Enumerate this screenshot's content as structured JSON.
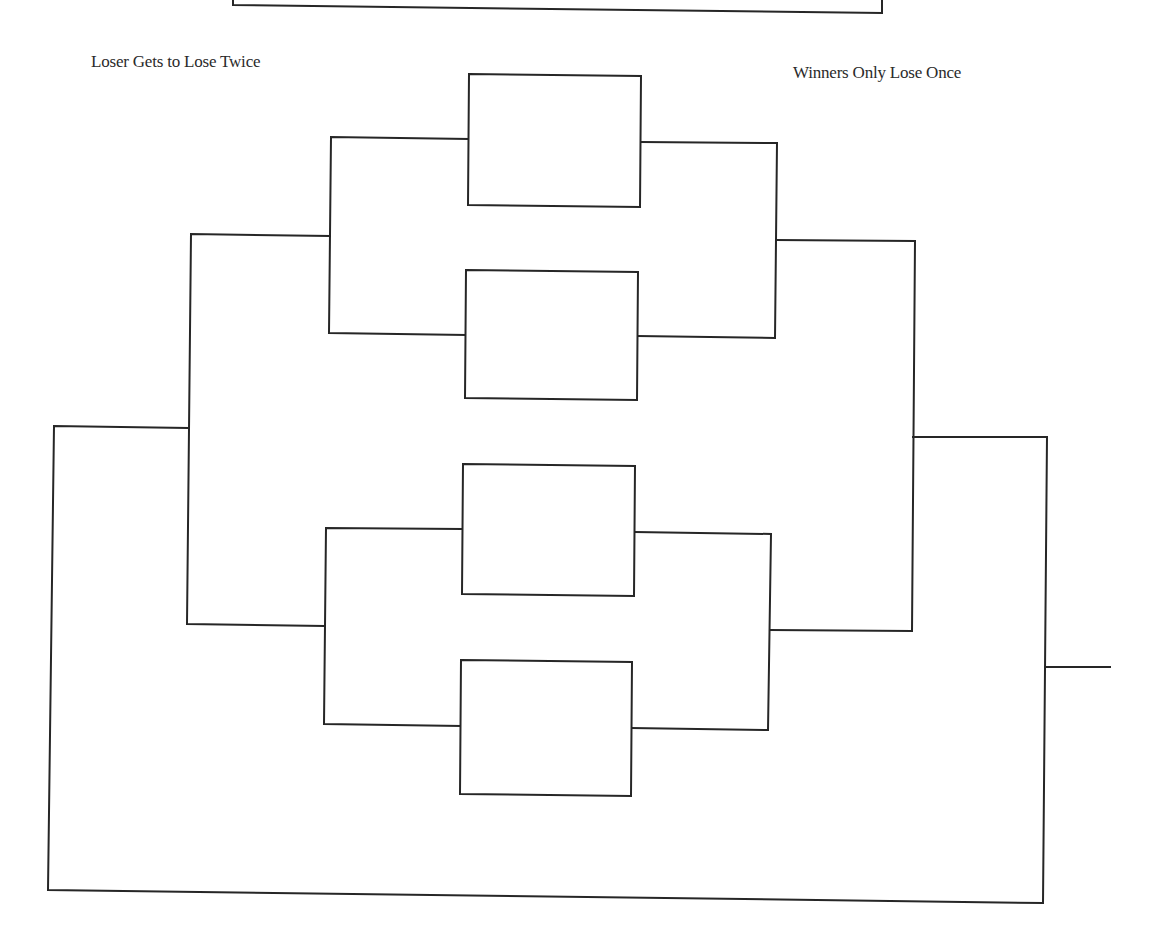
{
  "diagram": {
    "type": "tournament-bracket",
    "labels": {
      "left": "Loser Gets to Lose Twice",
      "right": "Winners Only Lose Once"
    },
    "colors": {
      "line": "#262626",
      "background": "#ffffff",
      "text": "#2a2a2a"
    },
    "top_partial_box": {
      "x1": 233,
      "y_left": 5,
      "x2": 882,
      "y_right": 13
    },
    "match_boxes": [
      {
        "id": "box-1",
        "points": "469,74 641,76 640,207 468,205"
      },
      {
        "id": "box-2",
        "points": "466,270 638,272 637,400 465,398"
      },
      {
        "id": "box-3",
        "points": "463,464 635,466 634,596 462,594"
      },
      {
        "id": "box-4",
        "points": "461,660 632,662 631,796 460,794"
      }
    ],
    "connectors": [
      {
        "id": "r1-left-top",
        "points": "469,139 331,137 329,333 466,335"
      },
      {
        "id": "r1-right-top",
        "points": "641,142 777,143 775,338 638,336"
      },
      {
        "id": "r1-left-bottom",
        "points": "463,529 326,528 324,724 461,726"
      },
      {
        "id": "r1-right-bottom",
        "points": "635,532 771,534 768,730 632,728"
      },
      {
        "id": "r2-left",
        "points": "330,236 191,234 187,624 324,626"
      },
      {
        "id": "r2-right",
        "points": "776,240 915,241 912,631 770,630"
      },
      {
        "id": "r3-left",
        "points": "188,428 54,426 48,890 1043,903 1047,437 913,437"
      },
      {
        "id": "champion-line",
        "points": "1045,667 1110,667"
      }
    ]
  }
}
